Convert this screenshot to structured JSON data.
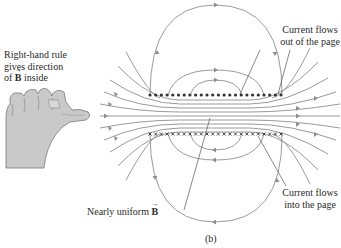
{
  "figure": {
    "panel_label": "(b)",
    "colors": {
      "field_line": "#8f8f8f",
      "leader_line": "#555555",
      "text": "#2a2a2a",
      "hand_fill": "#c9c9c9"
    }
  },
  "labels": {
    "right_hand_rule": {
      "line1": "Right-hand rule",
      "line2": "gives direction",
      "line3_prefix": "of ",
      "line3_symbol": "B",
      "line3_suffix": " inside"
    },
    "current_out": {
      "line1": "Current flows",
      "line2": "out of the page"
    },
    "current_in": {
      "line1": "Current flows",
      "line2": "into the page"
    },
    "uniform_field": {
      "prefix": "Nearly uniform ",
      "symbol": "B"
    }
  },
  "solenoid": {
    "top_row_symbol": "dots (current out of page)",
    "bottom_row_symbol": "crosses (current into page)",
    "turn_count": 24
  },
  "icons": {
    "hand": "right-hand-thumb-icon",
    "dot": "current-out-dot-icon",
    "cross": "current-in-cross-icon"
  }
}
